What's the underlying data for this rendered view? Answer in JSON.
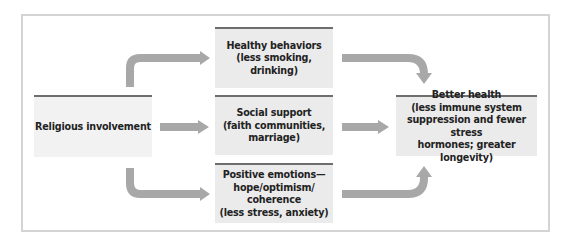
{
  "diagram": {
    "source": {
      "label": "Religious involvement"
    },
    "mediators": [
      {
        "lines": [
          "Healthy behaviors",
          "(less smoking, drinking)"
        ]
      },
      {
        "lines": [
          "Social support",
          "(faith communities,",
          "marriage)"
        ]
      },
      {
        "lines": [
          "Positive emotions—",
          "hope/optimism/",
          "coherence",
          "(less stress, anxiety)"
        ]
      }
    ],
    "outcome": {
      "lines": [
        "Better health",
        "(less immune system",
        "suppression and fewer stress",
        "hormones; greater longevity)"
      ]
    },
    "colors": {
      "box_fill": "#ebebeb",
      "box_top_rule": "#6e6e6e",
      "arrow": "#a8a8a8",
      "frame": "#d4d4d4"
    }
  }
}
